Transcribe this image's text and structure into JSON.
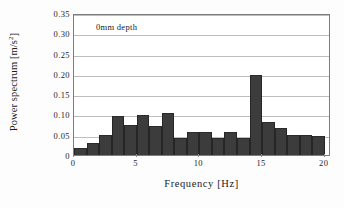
{
  "chart_data": {
    "type": "bar",
    "title": "",
    "annotation": "0mm depth",
    "xlabel": "Frequency [Hz]",
    "ylabel": "Power spectrum [m/s",
    "ylabel_sup": "2",
    "ylabel_suffix": "]",
    "ylabel_full": "Power spectrum [m/s2]",
    "xlim": [
      0,
      20.5
    ],
    "ylim": [
      0,
      0.35
    ],
    "grid": true,
    "legend": "none",
    "bar_color": "#3c3c3c",
    "grid_color": "#bdbdbd",
    "frame_color": "#7d7d7d",
    "xticks": [
      0,
      5,
      10,
      15,
      20
    ],
    "xtick_labels": [
      "0",
      "5",
      "10",
      "15",
      "20"
    ],
    "yticks": [
      0,
      0.05,
      0.1,
      0.15,
      0.2,
      0.25,
      0.3,
      0.35
    ],
    "ytick_labels": [
      "0",
      "0.05",
      "0.10",
      "0.15",
      "0.20",
      "0.25",
      "0.30",
      "0.35"
    ],
    "bin_width": 1,
    "x": [
      1,
      2,
      3,
      4,
      5,
      6,
      7,
      8,
      9,
      10,
      11,
      12,
      13,
      14,
      15,
      16,
      17,
      18,
      19,
      20
    ],
    "values": [
      0.018,
      0.03,
      0.05,
      0.096,
      0.075,
      0.098,
      0.072,
      0.104,
      0.043,
      0.056,
      0.056,
      0.042,
      0.057,
      0.043,
      0.196,
      0.082,
      0.067,
      0.05,
      0.049,
      0.047
    ]
  }
}
